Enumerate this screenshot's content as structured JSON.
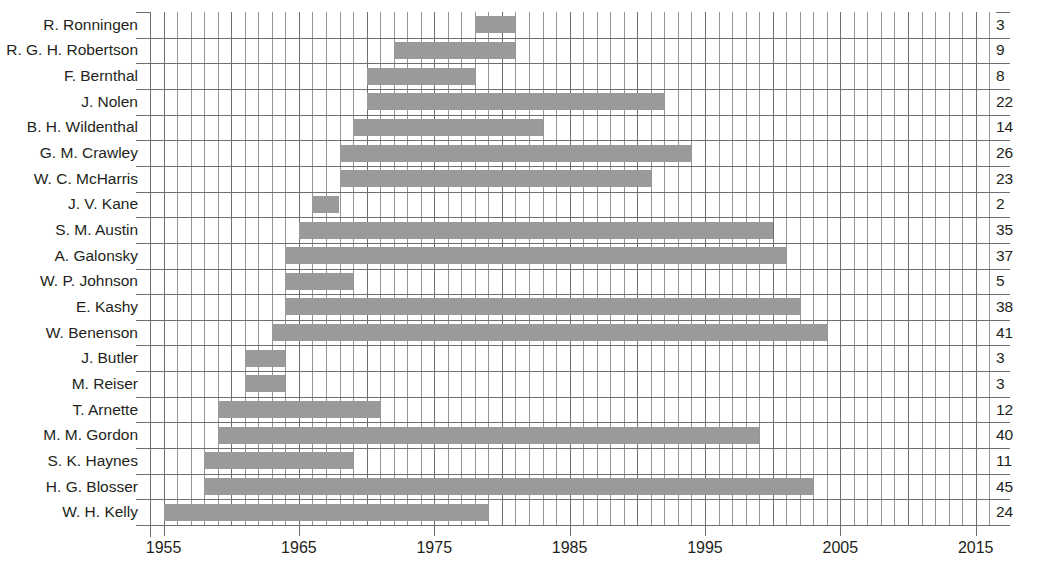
{
  "chart_data": {
    "type": "bar",
    "orientation": "horizontal",
    "subtype": "gantt-timeline",
    "title": "",
    "subtitle": "",
    "xlabel": "",
    "ylabel": "",
    "xlim": [
      1954,
      2016.5
    ],
    "xticks": [
      1955,
      1965,
      1975,
      1985,
      1995,
      2005,
      2015
    ],
    "xtick_labels": [
      "1955",
      "1965",
      "1975",
      "1985",
      "1995",
      "2005",
      "2015"
    ],
    "grid": true,
    "grid_minor_step_years": 1,
    "grid_major_step_years": 5,
    "legend": null,
    "bar_color": "#9a9a9a",
    "grid_color": "#6d6e71",
    "minor_grid_color": "#939598",
    "text_color": "#231f20",
    "right_axis_label": "",
    "categories": [
      "R. Ronningen",
      "R. G. H. Robertson",
      "F. Bernthal",
      "J. Nolen",
      "B. H. Wildenthal",
      "G. M. Crawley",
      "W. C. McHarris",
      "J. V. Kane",
      "S. M. Austin",
      "A. Galonsky",
      "W. P. Johnson",
      "E. Kashy",
      "W. Benenson",
      "J. Butler",
      "M. Reiser",
      "T. Arnette",
      "M. M. Gordon",
      "S. K. Haynes",
      "H. G. Blosser",
      "W. H. Kelly"
    ],
    "values": [
      3,
      9,
      8,
      22,
      14,
      26,
      23,
      2,
      35,
      37,
      5,
      38,
      41,
      3,
      3,
      12,
      40,
      11,
      45,
      24
    ],
    "bars": [
      {
        "name": "R. Ronningen",
        "start": 1978.0,
        "end": 1981.0,
        "years": 3
      },
      {
        "name": "R. G. H. Robertson",
        "start": 1972.0,
        "end": 1981.0,
        "years": 9
      },
      {
        "name": "F. Bernthal",
        "start": 1970.0,
        "end": 1978.0,
        "years": 8
      },
      {
        "name": "J. Nolen",
        "start": 1970.0,
        "end": 1992.0,
        "years": 22
      },
      {
        "name": "B. H. Wildenthal",
        "start": 1969.0,
        "end": 1983.0,
        "years": 14
      },
      {
        "name": "G. M. Crawley",
        "start": 1968.0,
        "end": 1994.0,
        "years": 26
      },
      {
        "name": "W. C. McHarris",
        "start": 1968.0,
        "end": 1991.0,
        "years": 23
      },
      {
        "name": "J. V. Kane",
        "start": 1966.0,
        "end": 1968.0,
        "years": 2
      },
      {
        "name": "S. M. Austin",
        "start": 1965.0,
        "end": 2000.0,
        "years": 35
      },
      {
        "name": "A. Galonsky",
        "start": 1964.0,
        "end": 2001.0,
        "years": 37
      },
      {
        "name": "W. P. Johnson",
        "start": 1964.0,
        "end": 1969.0,
        "years": 5
      },
      {
        "name": "E. Kashy",
        "start": 1964.0,
        "end": 2002.0,
        "years": 38
      },
      {
        "name": "W. Benenson",
        "start": 1963.0,
        "end": 2004.0,
        "years": 41
      },
      {
        "name": "J. Butler",
        "start": 1961.0,
        "end": 1964.0,
        "years": 3
      },
      {
        "name": "M. Reiser",
        "start": 1961.0,
        "end": 1964.0,
        "years": 3
      },
      {
        "name": "T. Arnette",
        "start": 1959.0,
        "end": 1971.0,
        "years": 12
      },
      {
        "name": "M. M. Gordon",
        "start": 1959.0,
        "end": 1999.0,
        "years": 40
      },
      {
        "name": "S. K. Haynes",
        "start": 1958.0,
        "end": 1969.0,
        "years": 11
      },
      {
        "name": "H. G. Blosser",
        "start": 1958.0,
        "end": 2003.0,
        "years": 45
      },
      {
        "name": "W. H. Kelly",
        "start": 1955.0,
        "end": 1979.0,
        "years": 24
      }
    ]
  }
}
